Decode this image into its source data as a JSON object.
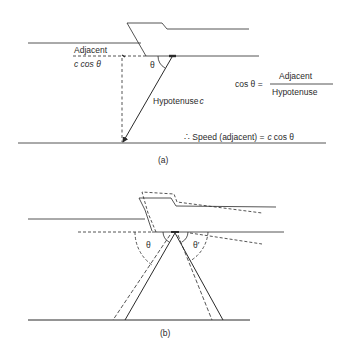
{
  "panel_a": {
    "caption": "(a)",
    "adjacent_label": "Adjacent",
    "adjacent_value": "c  cos θ",
    "theta": "θ",
    "hypotenuse_label": "Hypotenuse",
    "hypotenuse_var": "c",
    "formula": {
      "lhs": "cos θ =",
      "numerator": "Adjacent",
      "denominator": "Hypotenuse"
    },
    "conclusion": {
      "prefix": "∴ Speed (adjacent) =",
      "var": "c",
      "suffix": "cos θ"
    }
  },
  "panel_b": {
    "caption": "(b)",
    "theta": "θ",
    "theta_prime": "θ′"
  },
  "colors": {
    "ink": "#2a2a2a",
    "background": "#ffffff"
  }
}
